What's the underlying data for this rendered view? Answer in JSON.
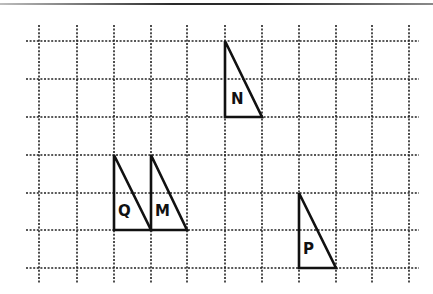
{
  "diagram": {
    "type": "grid-with-triangles",
    "grid": {
      "columns_x": [
        39,
        77,
        114,
        151,
        187,
        225,
        262,
        299,
        336,
        372,
        409
      ],
      "rows_y": [
        41,
        79,
        117,
        155,
        193,
        230,
        268
      ],
      "h_line_start_x": 26,
      "h_line_end_x": 419,
      "v_line_start_y": 25,
      "v_line_end_y": 284,
      "line_color": "#222222"
    },
    "shapes": [
      {
        "label": "N",
        "points": [
          [
            225,
            41
          ],
          [
            225,
            117
          ],
          [
            262,
            117
          ]
        ],
        "label_pos": [
          231,
          104
        ]
      },
      {
        "label": "Q",
        "points": [
          [
            114,
            155
          ],
          [
            114,
            230
          ],
          [
            151,
            230
          ]
        ],
        "label_pos": [
          118,
          216
        ]
      },
      {
        "label": "M",
        "points": [
          [
            151,
            155
          ],
          [
            151,
            230
          ],
          [
            187,
            230
          ]
        ],
        "label_pos": [
          155,
          216
        ]
      },
      {
        "label": "P",
        "points": [
          [
            299,
            193
          ],
          [
            299,
            268
          ],
          [
            336,
            268
          ]
        ],
        "label_pos": [
          303,
          254
        ]
      }
    ],
    "stroke_color": "#111111"
  }
}
